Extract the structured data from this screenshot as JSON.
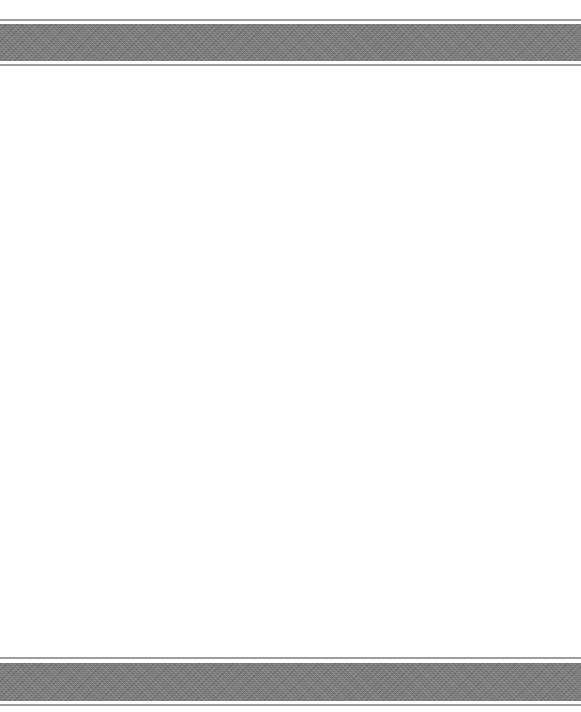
{
  "document": {
    "type": "blank-page",
    "header": {
      "decoration": "textured-gray-band",
      "band_color": "#7b7b7b",
      "rule_color": "#8c8c8c"
    },
    "body": {
      "text": ""
    },
    "footer": {
      "decoration": "textured-gray-band",
      "band_color": "#7b7b7b",
      "rule_color": "#8c8c8c"
    },
    "background_color": "#fefefe"
  }
}
